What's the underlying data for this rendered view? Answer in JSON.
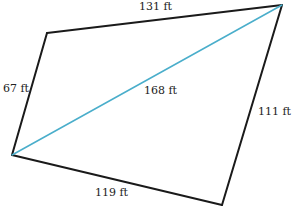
{
  "diagram": {
    "type": "quadrilateral",
    "vertices": {
      "top_left": [
        47,
        33
      ],
      "top_right": [
        282,
        5
      ],
      "bottom_right": [
        222,
        205
      ],
      "left": [
        12,
        155
      ]
    },
    "edges": [
      {
        "id": "top",
        "from": "top_left",
        "to": "top_right",
        "label": "131 ft"
      },
      {
        "id": "right",
        "from": "top_right",
        "to": "bottom_right",
        "label": "111 ft"
      },
      {
        "id": "bottom",
        "from": "left",
        "to": "bottom_right",
        "label": "119 ft"
      },
      {
        "id": "left",
        "from": "left",
        "to": "top_left",
        "label": "67 ft"
      }
    ],
    "diagonal": {
      "from": "left",
      "to": "top_right",
      "label": "168 ft",
      "color": "#4aaecb"
    },
    "edge_color": "#1a1a1a"
  },
  "labels": {
    "top": "131 ft",
    "right": "111 ft",
    "bottom": "119 ft",
    "left": "67 ft",
    "diagonal": "168 ft"
  }
}
